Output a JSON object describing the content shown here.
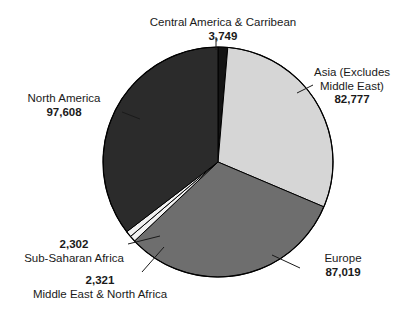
{
  "chart_data": {
    "type": "pie",
    "title": "",
    "subtitle": "",
    "xlabel": "",
    "ylabel": "",
    "legend_position": "none",
    "grid": false,
    "total": 275776,
    "slices": [
      {
        "name": "Central America & Carribean",
        "value": 3749,
        "value_label": "3,749",
        "color": "#141414",
        "start_angle": -90.0,
        "sweep_angle": 4.895,
        "percent": 1.36
      },
      {
        "name": "Asia (Excludes Middle East)",
        "value": 82777,
        "value_label": "82,777",
        "name_line_1": "Asia (Excludes",
        "name_line_2": "Middle East)",
        "color": "#d6d6d6",
        "start_angle": -85.105,
        "sweep_angle": 108.069,
        "percent": 30.02
      },
      {
        "name": "Europe",
        "value": 87019,
        "value_label": "87,019",
        "color": "#6e6e6e",
        "start_angle": 22.964,
        "sweep_angle": 113.607,
        "percent": 31.55
      },
      {
        "name": "Middle East & North Africa",
        "value": 2321,
        "value_label": "2,321",
        "color": "#f2f2f2",
        "start_angle": 136.571,
        "sweep_angle": 3.03,
        "percent": 0.84
      },
      {
        "name": "Sub-Saharan Africa",
        "value": 2302,
        "value_label": "2,302",
        "color": "#f2f2f2",
        "start_angle": 139.601,
        "sweep_angle": 3.005,
        "percent": 0.83
      },
      {
        "name": "North America",
        "value": 97608,
        "value_label": "97,608",
        "color": "#2b2b2b",
        "start_angle": 142.606,
        "sweep_angle": 127.394,
        "percent": 35.39
      }
    ]
  },
  "labels": {
    "central": {
      "name": "Central America & Carribean",
      "value": "3,749"
    },
    "asia": {
      "name_line_1": "Asia (Excludes",
      "name_line_2": "Middle East)",
      "value": "82,777"
    },
    "north_america": {
      "name": "North America",
      "value": "97,608"
    },
    "europe": {
      "name": "Europe",
      "value": "87,019"
    },
    "sub_saharan_africa": {
      "name": "Sub-Saharan Africa",
      "value": "2,302"
    },
    "middle_east_north_africa": {
      "name": "Middle East & North Africa",
      "value": "2,321"
    }
  },
  "colors": {
    "background": "#ffffff",
    "text": "#1a1a1a",
    "outline": "#000000",
    "central_america": "#141414",
    "asia": "#d6d6d6",
    "europe": "#6e6e6e",
    "north_america": "#2b2b2b",
    "small_slices": "#f2f2f2"
  }
}
